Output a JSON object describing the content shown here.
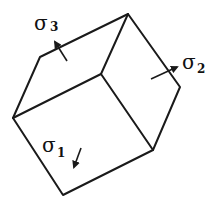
{
  "diagram": {
    "type": "stress-cube",
    "labels": [
      {
        "id": "sigma1",
        "symbol": "σ",
        "subscript": "1"
      },
      {
        "id": "sigma2",
        "symbol": "σ",
        "subscript": "2"
      },
      {
        "id": "sigma3",
        "symbol": "σ",
        "subscript": "3"
      }
    ],
    "colors": {
      "line": "#1a1a1a",
      "background": "#ffffff"
    }
  }
}
